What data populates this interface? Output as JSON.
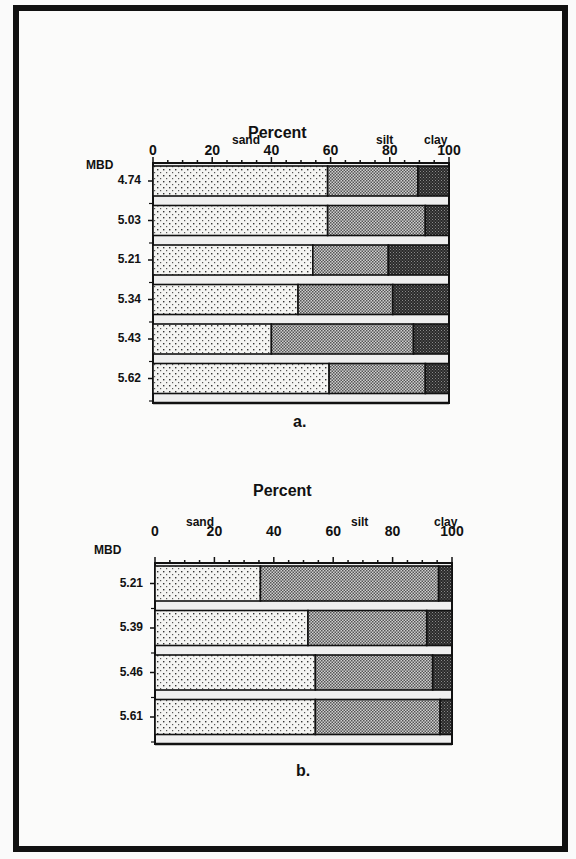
{
  "chart_data": [
    {
      "type": "bar",
      "orientation": "horizontal",
      "stacked": true,
      "title": "Percent",
      "caption": "a.",
      "ylabel": "MBD",
      "xlim": [
        0,
        100
      ],
      "xticks": [
        "0",
        "20",
        "40",
        "60",
        "80",
        "100"
      ],
      "segment_labels": [
        "sand",
        "silt",
        "clay"
      ],
      "categories": [
        "4.74",
        "5.03",
        "5.21",
        "5.34",
        "5.43",
        "5.62"
      ],
      "series": [
        {
          "name": "sand",
          "values": [
            59,
            59,
            54,
            49,
            40,
            59.5
          ]
        },
        {
          "name": "silt",
          "values": [
            30.5,
            33,
            25.5,
            32,
            48,
            32.5
          ]
        },
        {
          "name": "clay",
          "values": [
            10.5,
            8,
            20.5,
            19,
            12,
            8
          ]
        }
      ],
      "grid": false
    },
    {
      "type": "bar",
      "orientation": "horizontal",
      "stacked": true,
      "title": "Percent",
      "caption": "b.",
      "ylabel": "MBD",
      "xlim": [
        0,
        100
      ],
      "xticks": [
        "0",
        "20",
        "40",
        "60",
        "80",
        "100"
      ],
      "segment_labels": [
        "sand",
        "silt",
        "clay"
      ],
      "categories": [
        "5.21",
        "5.39",
        "5.46",
        "5.61"
      ],
      "series": [
        {
          "name": "sand",
          "values": [
            35.5,
            51.5,
            54,
            54
          ]
        },
        {
          "name": "silt",
          "values": [
            60,
            40,
            39.5,
            42
          ]
        },
        {
          "name": "clay",
          "values": [
            4.5,
            8.5,
            6.5,
            4
          ]
        }
      ],
      "grid": false
    }
  ],
  "figures": [
    {
      "title": "Percent",
      "caption": "a.",
      "mbd_label": "MBD",
      "seg": {
        "sand": "sand",
        "silt": "silt",
        "clay": "clay"
      },
      "ticks": [
        "0",
        "20",
        "40",
        "60",
        "80",
        "100"
      ],
      "rows": [
        "4.74",
        "5.03",
        "5.21",
        "5.34",
        "5.43",
        "5.62"
      ]
    },
    {
      "title": "Percent",
      "caption": "b.",
      "mbd_label": "MBD",
      "seg": {
        "sand": "sand",
        "silt": "silt",
        "clay": "clay"
      },
      "ticks": [
        "0",
        "20",
        "40",
        "60",
        "80",
        "100"
      ],
      "rows": [
        "5.21",
        "5.39",
        "5.46",
        "5.61"
      ]
    }
  ],
  "colors": {
    "sand": "#f2f2f2",
    "silt": "#9a9a9a",
    "clay": "#2a2a2a",
    "ink": "#111111"
  }
}
